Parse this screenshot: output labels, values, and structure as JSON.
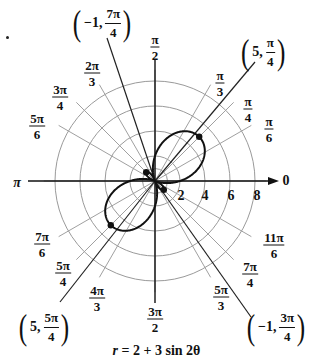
{
  "figure": {
    "equation": "r = 2 + 3 sin 2θ",
    "equation_parts": {
      "r": "r",
      "rest": " = 2 + 3 sin 2θ"
    },
    "center": {
      "x": 155,
      "y": 181
    },
    "px_per_unit": 12.5,
    "rings": [
      1,
      2,
      4,
      6,
      8
    ],
    "radial_tick_labels": [
      "2",
      "4",
      "6",
      "8"
    ],
    "axis_zero_label": "0",
    "axis_pi_label": "π",
    "angle_labels": [
      {
        "id": "pi2",
        "num": "π",
        "den": "2",
        "x": 155,
        "y": 47
      },
      {
        "id": "pi3",
        "num": "π",
        "den": "3",
        "x": 220,
        "y": 83
      },
      {
        "id": "pi4",
        "num": "π",
        "den": "4",
        "x": 248,
        "y": 109
      },
      {
        "id": "pi6",
        "num": "π",
        "den": "6",
        "x": 269,
        "y": 129
      },
      {
        "id": "2pi3",
        "num": "2π",
        "den": "3",
        "x": 92,
        "y": 73
      },
      {
        "id": "3pi4",
        "num": "3π",
        "den": "4",
        "x": 60,
        "y": 97
      },
      {
        "id": "5pi6",
        "num": "5π",
        "den": "6",
        "x": 37,
        "y": 126
      },
      {
        "id": "7pi6",
        "num": "7π",
        "den": "6",
        "x": 42,
        "y": 244
      },
      {
        "id": "5pi4",
        "num": "5π",
        "den": "4",
        "x": 63,
        "y": 273
      },
      {
        "id": "4pi3",
        "num": "4π",
        "den": "3",
        "x": 97,
        "y": 298
      },
      {
        "id": "3pi2",
        "num": "3π",
        "den": "2",
        "x": 155,
        "y": 319
      },
      {
        "id": "5pi3",
        "num": "5π",
        "den": "3",
        "x": 221,
        "y": 297
      },
      {
        "id": "7pi4",
        "num": "7π",
        "den": "4",
        "x": 250,
        "y": 274
      },
      {
        "id": "11pi6",
        "num": "11π",
        "den": "6",
        "x": 274,
        "y": 245
      }
    ],
    "points": [
      {
        "id": "p1",
        "r": "5",
        "num": "π",
        "den": "4",
        "x": 263,
        "y": 52
      },
      {
        "id": "p2",
        "r": "−1",
        "num": "7π",
        "den": "4",
        "x": 102,
        "y": 23
      },
      {
        "id": "p3",
        "r": "5",
        "num": "5π",
        "den": "4",
        "x": 44,
        "y": 327
      },
      {
        "id": "p4",
        "r": "−1",
        "num": "3π",
        "den": "4",
        "x": 276,
        "y": 327
      }
    ]
  },
  "chart_data": {
    "type": "line",
    "title": "r = 2 + 3 sin 2θ",
    "coordinate_system": "polar",
    "function": "r = 2 + 3*sin(2*theta)",
    "radial_ticks": [
      2,
      4,
      6,
      8
    ],
    "rmax": 8,
    "angle_ticks": [
      "0",
      "π/6",
      "π/4",
      "π/3",
      "π/2",
      "2π/3",
      "3π/4",
      "5π/6",
      "π",
      "7π/6",
      "5π/4",
      "4π/3",
      "3π/2",
      "5π/3",
      "7π/4",
      "11π/6"
    ],
    "highlighted_points": [
      {
        "label": "(5, π/4)",
        "r": 5,
        "theta": "π/4"
      },
      {
        "label": "(−1, 7π/4)",
        "r": -1,
        "theta": "7π/4"
      },
      {
        "label": "(5, 5π/4)",
        "r": 5,
        "theta": "5π/4"
      },
      {
        "label": "(−1, 3π/4)",
        "r": -1,
        "theta": "3π/4"
      }
    ],
    "grid": true,
    "legend": null
  }
}
